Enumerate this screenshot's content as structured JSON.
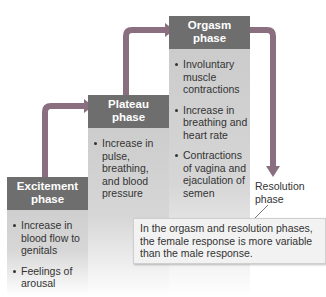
{
  "diagram": {
    "phases": [
      {
        "title_line1": "Excitement",
        "title_line2": "phase",
        "bullets": [
          "Increase in blood flow to genitals",
          "Feelings of arousal"
        ]
      },
      {
        "title_line1": "Plateau",
        "title_line2": "phase",
        "bullets": [
          "Increase in pulse, breathing, and blood pressure"
        ]
      },
      {
        "title_line1": "Orgasm",
        "title_line2": "phase",
        "bullets": [
          "Involuntary muscle contractions",
          "Increase in breathing and heart rate",
          "Contractions of vagina and ejaculation of semen"
        ]
      }
    ],
    "resolution_label": "Resolution phase",
    "note": "In the orgasm and resolution phases, the female response is more variable than the male response.",
    "colors": {
      "header": "#6e6e6e",
      "body": "#c9c9c9",
      "arrow": "#8a6f80",
      "note_bg": "#f2f2f2"
    }
  }
}
